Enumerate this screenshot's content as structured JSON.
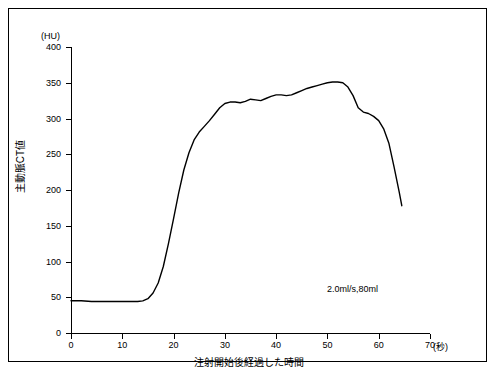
{
  "chart_data": {
    "type": "line",
    "title": "",
    "xlabel": "注射開始後経過した時間",
    "ylabel": "主動脈CT値",
    "x_unit": "(秒)",
    "y_unit": "(HU)",
    "xlim": [
      0,
      70
    ],
    "ylim": [
      0,
      400
    ],
    "xticks": [
      0,
      10,
      20,
      30,
      40,
      50,
      60,
      70
    ],
    "yticks": [
      0,
      50,
      100,
      150,
      200,
      250,
      300,
      350,
      400
    ],
    "grid": false,
    "legend": "none",
    "annotations": [
      "2.0ml/s,80ml"
    ],
    "series": [
      {
        "name": "主動脈CT値",
        "x": [
          0,
          2,
          4,
          6,
          8,
          10,
          12,
          13,
          14,
          15,
          16,
          17,
          18,
          19,
          20,
          21,
          22,
          23,
          24,
          25,
          26,
          27,
          28,
          29,
          30,
          31,
          32,
          33,
          34,
          35,
          36,
          37,
          38,
          39,
          40,
          41,
          42,
          43,
          44,
          45,
          46,
          47,
          48,
          49,
          50,
          51,
          52,
          53,
          54,
          55,
          56,
          57,
          58,
          59,
          60,
          61,
          62,
          63,
          64,
          64.5
        ],
        "y": [
          45,
          45,
          44,
          44,
          44,
          44,
          44,
          44,
          45,
          48,
          56,
          70,
          93,
          125,
          160,
          196,
          228,
          252,
          270,
          281,
          289,
          297,
          306,
          315,
          321,
          323,
          323,
          322,
          324,
          327,
          326,
          325,
          328,
          331,
          333,
          333,
          332,
          333,
          336,
          339,
          342,
          344,
          346,
          348,
          350,
          351,
          351,
          350,
          344,
          332,
          315,
          309,
          307,
          303,
          297,
          285,
          265,
          232,
          197,
          178
        ]
      }
    ]
  },
  "ytick_labels": [
    "400",
    "350",
    "300",
    "250",
    "200",
    "150",
    "100",
    "50",
    "0"
  ],
  "xtick_labels": [
    "0",
    "10",
    "20",
    "30",
    "40",
    "50",
    "60",
    "70"
  ]
}
